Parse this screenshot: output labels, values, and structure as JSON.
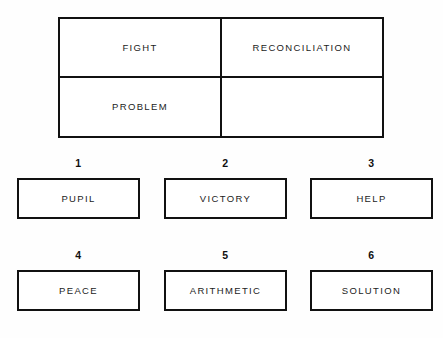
{
  "worksheet": {
    "background_color": "#fefefe",
    "line_color": "#111111",
    "text_color": "#1c1c1c"
  },
  "word_table": {
    "rows": [
      [
        {
          "text": "FIGHT",
          "empty": false
        },
        {
          "text": "RECONCILIATION",
          "empty": false
        }
      ],
      [
        {
          "text": "PROBLEM",
          "empty": false
        },
        {
          "text": "",
          "empty": true
        }
      ]
    ]
  },
  "numbered_boxes": [
    {
      "number": "1",
      "label": "PUPIL"
    },
    {
      "number": "2",
      "label": "VICTORY"
    },
    {
      "number": "3",
      "label": "HELP"
    },
    {
      "number": "4",
      "label": "PEACE"
    },
    {
      "number": "5",
      "label": "ARITHMETIC"
    },
    {
      "number": "6",
      "label": "SOLUTION"
    }
  ]
}
